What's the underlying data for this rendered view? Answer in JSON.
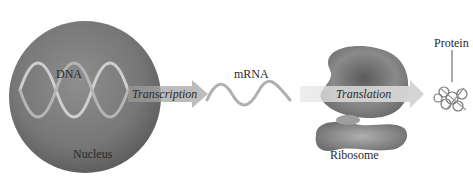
{
  "diagram": {
    "type": "process-flow",
    "title": "",
    "nodes": [
      {
        "id": "nucleus",
        "label": "Nucleus"
      },
      {
        "id": "dna",
        "label": "DNA"
      },
      {
        "id": "mrna",
        "label": "mRNA"
      },
      {
        "id": "ribosome",
        "label": "Ribosome"
      },
      {
        "id": "protein",
        "label": "Protein"
      }
    ],
    "edges": [
      {
        "from": "dna",
        "to": "mrna",
        "label": "Transcription"
      },
      {
        "from": "mrna",
        "to": "protein",
        "label": "Translation"
      }
    ]
  },
  "labels": {
    "dna": "DNA",
    "nucleus": "Nucleus",
    "transcription": "Transcription",
    "mrna": "mRNA",
    "translation": "Translation",
    "ribosome": "Ribosome",
    "protein": "Protein"
  },
  "colors": {
    "nucleus_fill": "#7a7a7a",
    "ribosome_fill": "#6e6e6e",
    "arrow_fill": "#c8c8c8",
    "background": "#ffffff"
  }
}
